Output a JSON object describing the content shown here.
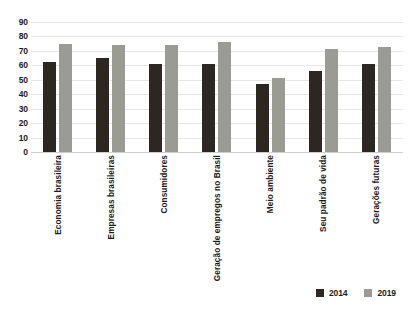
{
  "chart_data": {
    "type": "bar",
    "title": "",
    "xlabel": "",
    "ylabel": "",
    "ylim": [
      0,
      90
    ],
    "yticks": [
      90,
      80,
      70,
      60,
      50,
      40,
      30,
      20,
      10,
      0
    ],
    "grid": true,
    "legend_position": "bottom-right",
    "categories": [
      "Economia brasileira",
      "Empresas brasileiras",
      "Consumidores",
      "Geração de empregos no Brasil",
      "Meio ambiente",
      "Seu padrão de vida",
      "Gerações futuras"
    ],
    "series": [
      {
        "name": "2014",
        "color": "#2d2724",
        "values": [
          62,
          65,
          61,
          61,
          47,
          56,
          61
        ]
      },
      {
        "name": "2019",
        "color": "#9b9b96",
        "values": [
          75,
          74,
          74,
          76,
          51,
          71,
          73
        ]
      }
    ]
  },
  "legend": {
    "items": [
      {
        "label": "2014",
        "color": "#2d2724"
      },
      {
        "label": "2019",
        "color": "#9b9b96"
      }
    ]
  },
  "colors": {
    "series_2014": "#2d2724",
    "series_2019": "#9b9b96",
    "gridline": "#e6e6e4",
    "axis": "#cfcfcb",
    "text": "#1b1b1b",
    "background": "#ffffff"
  }
}
